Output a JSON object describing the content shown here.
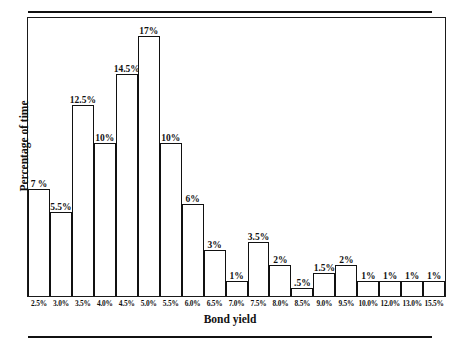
{
  "figure": {
    "rules": {
      "top": "",
      "bottom": ""
    }
  },
  "chart_data": {
    "type": "bar",
    "title": "",
    "xlabel": "Bond yield",
    "ylabel": "Percentage of time",
    "grid": false,
    "legend": false,
    "ylim": [
      0,
      18
    ],
    "categories": [
      "2.5%",
      "3.0%",
      "3.5%",
      "4.0%",
      "4.5%",
      "5.0%",
      "5.5%",
      "6.0%",
      "6.5%",
      "7.0%",
      "7.5%",
      "8.0%",
      "8.5%",
      "9.0%",
      "9.5%",
      "10.0%",
      "12.0%",
      "13.0%",
      "15.5%"
    ],
    "values": [
      7,
      5.5,
      12.5,
      10,
      14.5,
      17,
      10,
      6,
      3,
      1,
      3.5,
      2,
      0.5,
      1.5,
      2,
      1,
      1,
      1,
      1
    ],
    "value_labels": [
      "7 %",
      "5.5%",
      "12.5%",
      "10%",
      "14.5%",
      "17%",
      "10%",
      "6%",
      "3%",
      "1%",
      "3.5%",
      "2%",
      ".5%",
      "1.5%",
      "2%",
      "1%",
      "1%",
      "1%",
      "1%"
    ]
  }
}
